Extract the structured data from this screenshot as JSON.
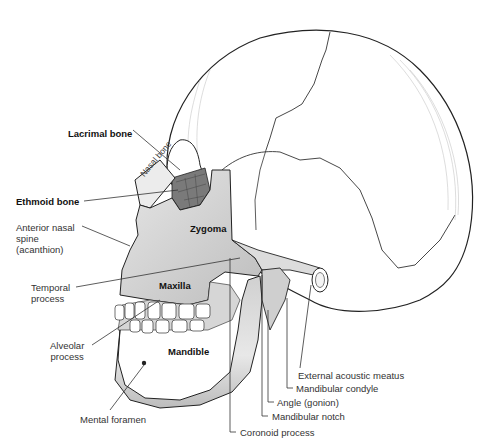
{
  "figure": {
    "labels": {
      "lacrimal_bone": "Lacrimal bone",
      "nasal_bone": "Nasal bone",
      "ethmoid_bone": "Ethmoid bone",
      "anterior_nasal_spine": "Anterior nasal\nspine\n(acanthion)",
      "zygoma": "Zygoma",
      "temporal_process": "Temporal\nprocess",
      "maxilla": "Maxilla",
      "alveolar_process": "Alveolar\nprocess",
      "mandible": "Mandible",
      "mental_foramen": "Mental foramen",
      "external_acoustic_meatus": "External acoustic meatus",
      "mandibular_condyle": "Mandibular condyle",
      "angle_gonion": "Angle (gonion)",
      "mandibular_notch": "Mandibular notch",
      "coronoid_process": "Coronoid process"
    },
    "colors": {
      "bone_light": "#ffffff",
      "bone_shaded": "#d8d8d8",
      "bone_dark": "#9a9a9a",
      "outline": "#222222",
      "leader": "#333333"
    }
  }
}
